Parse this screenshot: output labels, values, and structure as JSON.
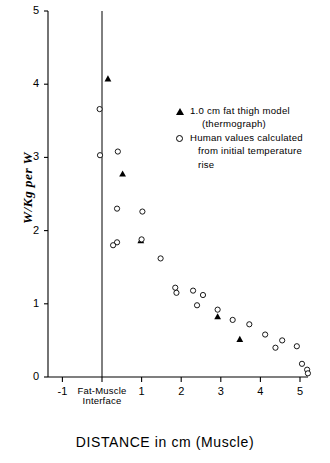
{
  "chart_data": {
    "type": "scatter",
    "title": "",
    "xlabel": "DISTANCE in cm (Muscle)",
    "ylabel": "W/Kg per W",
    "xlim": [
      -1.3,
      5.5
    ],
    "ylim": [
      0,
      5
    ],
    "grid": false,
    "xticks": [
      -1,
      0,
      1,
      2,
      3,
      4,
      5
    ],
    "xticklabels": [
      "-1",
      "",
      "1",
      "2",
      "3",
      "4",
      "5"
    ],
    "yticks": [
      0,
      1,
      2,
      3,
      4,
      5
    ],
    "yticklabels": [
      "0",
      "1",
      "2",
      "3",
      "4",
      "5"
    ],
    "annotations": [
      {
        "text": "Fat-Muscle",
        "x": 0,
        "y": 0,
        "position": "below-axis"
      },
      {
        "text": "Interface",
        "x": 0,
        "y": 0,
        "position": "below-axis"
      }
    ],
    "reference_lines": [
      {
        "orientation": "vertical",
        "x": 0,
        "label": "Fat-Muscle Interface"
      }
    ],
    "legend_position": "upper-right",
    "series": [
      {
        "name": "1.0 cm fat thigh model (thermograph)",
        "marker": "filled-triangle",
        "color": "#000000",
        "points": [
          [
            0.15,
            4.08
          ],
          [
            0.52,
            2.78
          ],
          [
            0.98,
            1.87
          ],
          [
            2.92,
            0.83
          ],
          [
            3.48,
            0.52
          ]
        ]
      },
      {
        "name": "Human values calculated from initial temperature rise",
        "marker": "open-circle",
        "color": "#000000",
        "points": [
          [
            -0.06,
            3.66
          ],
          [
            -0.05,
            3.03
          ],
          [
            0.4,
            3.08
          ],
          [
            0.38,
            2.3
          ],
          [
            0.38,
            1.84
          ],
          [
            0.28,
            1.8
          ],
          [
            1.02,
            2.26
          ],
          [
            1.0,
            1.88
          ],
          [
            1.48,
            1.62
          ],
          [
            1.85,
            1.22
          ],
          [
            1.88,
            1.15
          ],
          [
            2.3,
            1.18
          ],
          [
            2.55,
            1.12
          ],
          [
            2.4,
            0.98
          ],
          [
            2.92,
            0.92
          ],
          [
            3.3,
            0.78
          ],
          [
            3.72,
            0.72
          ],
          [
            4.12,
            0.58
          ],
          [
            4.38,
            0.4
          ],
          [
            4.55,
            0.5
          ],
          [
            4.92,
            0.42
          ],
          [
            5.05,
            0.18
          ],
          [
            5.18,
            0.1
          ],
          [
            5.2,
            0.05
          ]
        ]
      }
    ]
  },
  "legend": {
    "entry1_line1": "1.0 cm fat thigh model",
    "entry1_line2": "(thermograph)",
    "entry2_line1": "Human values calculated",
    "entry2_line2": "from initial temperature",
    "entry2_line3": "rise"
  },
  "axes": {
    "xlabel": "DISTANCE in cm (Muscle)",
    "ylabel": "W/Kg per W",
    "interface_line1": "Fat-Muscle",
    "interface_line2": "Interface"
  }
}
